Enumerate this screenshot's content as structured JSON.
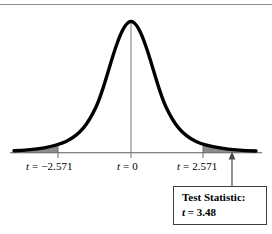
{
  "figure": {
    "name": "t-distribution-hypothesis-test-figure",
    "top_rule": true,
    "background_color": "#ffffff",
    "curve_color": "#000000",
    "shade_color": "#8c8c8c",
    "axis_color": "#5a5a5a",
    "box_border_color": "#3d3d3d"
  },
  "axis_labels": {
    "negative_critical": "t = −2.571",
    "center": "t = 0",
    "positive_critical": "t = 2.571"
  },
  "callout": {
    "line1": "Test Statistic:",
    "line2": "t = 3.48"
  },
  "chart_data": {
    "type": "line",
    "title": "",
    "subtitle": "",
    "xlabel": "",
    "ylabel": "",
    "distribution": "Student t distribution",
    "grid": false,
    "legend": null,
    "xlim": [
      -5.0,
      5.0
    ],
    "ylim": [
      0,
      1
    ],
    "tick_values": [
      -2.571,
      0,
      2.571
    ],
    "tick_labels": [
      "t = −2.571",
      "t = 0",
      "t = 2.571"
    ],
    "critical_values": [
      -2.571,
      2.571
    ],
    "test_statistic": 3.48,
    "shaded_regions": [
      {
        "name": "left-rejection-region",
        "from": -5.0,
        "to": -2.571,
        "color": "#8c8c8c"
      },
      {
        "name": "right-rejection-region",
        "from": 2.571,
        "to": 5.0,
        "color": "#8c8c8c"
      }
    ],
    "annotations": [
      {
        "text": "Test Statistic: t = 3.48",
        "points_to_x": 3.48,
        "points_to_y": 0
      }
    ],
    "x": [
      -5.0,
      -4.6,
      -4.2,
      -3.8,
      -3.4,
      -3.0,
      -2.6,
      -2.2,
      -1.8,
      -1.4,
      -1.0,
      -0.6,
      -0.2,
      0.0,
      0.2,
      0.6,
      1.0,
      1.4,
      1.8,
      2.2,
      2.6,
      3.0,
      3.4,
      3.8,
      4.2,
      4.6,
      5.0
    ],
    "y": [
      0.012,
      0.016,
      0.022,
      0.031,
      0.045,
      0.067,
      0.103,
      0.163,
      0.262,
      0.415,
      0.612,
      0.814,
      0.966,
      1.0,
      0.966,
      0.814,
      0.612,
      0.415,
      0.262,
      0.163,
      0.103,
      0.067,
      0.045,
      0.031,
      0.022,
      0.016,
      0.012
    ]
  }
}
